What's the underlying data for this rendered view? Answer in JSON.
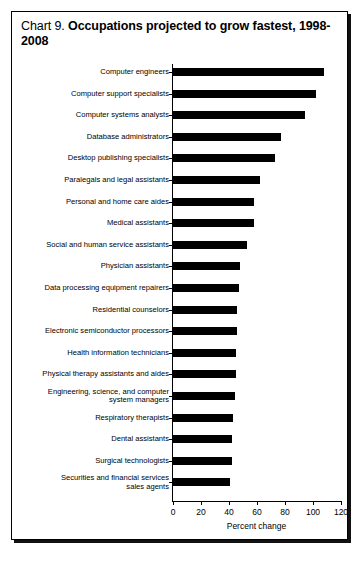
{
  "title": {
    "prefix": "Chart 9. ",
    "main": "Occupations projected to grow fastest, 1998-2008"
  },
  "chart_data": {
    "type": "bar",
    "orientation": "horizontal",
    "title": "Chart 9. Occupations projected to grow fastest, 1998-2008",
    "xlabel": "Percent change",
    "ylabel": "",
    "xlim": [
      0,
      120
    ],
    "xticks": [
      0,
      20,
      40,
      60,
      80,
      100,
      120
    ],
    "grid": false,
    "legend": false,
    "categories": [
      "Computer engineers",
      "Computer support specialists",
      "Computer systems analysts",
      "Database administrators",
      "Desktop publishing specialists",
      "Paralegals and legal assistants",
      "Personal and home care aides",
      "Medical assistants",
      "Social and human service assistants",
      "Physician assistants",
      "Data processing equipment repairers",
      "Residential counselors",
      "Electronic semiconductor processors",
      "Health information technicians",
      "Physical therapy assistants and aides",
      "Engineering, science, and computer\nsystem managers",
      "Respiratory therapists",
      "Dental assistants",
      "Surgical technologists",
      "Securities and financial services\nsales agents"
    ],
    "values": [
      108,
      102,
      94,
      77,
      73,
      62,
      58,
      58,
      53,
      48,
      47,
      46,
      46,
      45,
      45,
      44,
      43,
      42,
      42,
      41
    ]
  }
}
